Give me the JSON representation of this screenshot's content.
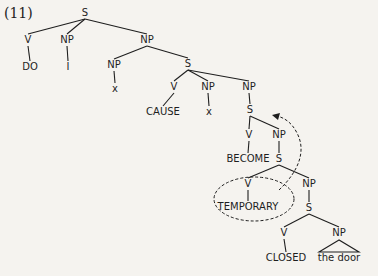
{
  "example_number": "(11)",
  "colors": {
    "ink": "#1e1e1e",
    "background": "#f5f3ef"
  },
  "nodes": [
    {
      "id": "s0",
      "label": "S",
      "x": 85,
      "y": 13
    },
    {
      "id": "v1",
      "label": "V",
      "x": 28,
      "y": 40
    },
    {
      "id": "np1",
      "label": "NP",
      "x": 67,
      "y": 40
    },
    {
      "id": "np2",
      "label": "NP",
      "x": 147,
      "y": 40
    },
    {
      "id": "do",
      "label": "DO",
      "x": 30,
      "y": 67
    },
    {
      "id": "i",
      "label": "I",
      "x": 68,
      "y": 67
    },
    {
      "id": "np3",
      "label": "NP",
      "x": 114,
      "y": 65
    },
    {
      "id": "s1",
      "label": "S",
      "x": 188,
      "y": 64
    },
    {
      "id": "x1",
      "label": "x",
      "x": 115,
      "y": 89
    },
    {
      "id": "v2",
      "label": "V",
      "x": 174,
      "y": 87
    },
    {
      "id": "np4",
      "label": "NP",
      "x": 208,
      "y": 87
    },
    {
      "id": "np5",
      "label": "NP",
      "x": 249,
      "y": 87
    },
    {
      "id": "cause",
      "label": "CAUSE",
      "x": 163,
      "y": 112
    },
    {
      "id": "x2",
      "label": "x",
      "x": 209,
      "y": 112
    },
    {
      "id": "s2",
      "label": "S",
      "x": 250,
      "y": 110
    },
    {
      "id": "v3",
      "label": "V",
      "x": 249,
      "y": 135
    },
    {
      "id": "np6",
      "label": "NP",
      "x": 279,
      "y": 135
    },
    {
      "id": "become",
      "label": "BECOME",
      "x": 248,
      "y": 159
    },
    {
      "id": "s3",
      "label": "S",
      "x": 279,
      "y": 159
    },
    {
      "id": "v4",
      "label": "V",
      "x": 248,
      "y": 184
    },
    {
      "id": "np7",
      "label": "NP",
      "x": 309,
      "y": 184
    },
    {
      "id": "temporary",
      "label": "TEMPORARY",
      "x": 248,
      "y": 207
    },
    {
      "id": "s4",
      "label": "S",
      "x": 309,
      "y": 208
    },
    {
      "id": "v5",
      "label": "V",
      "x": 284,
      "y": 233
    },
    {
      "id": "np8",
      "label": "NP",
      "x": 339,
      "y": 233
    },
    {
      "id": "closed",
      "label": "CLOSED",
      "x": 286,
      "y": 258
    },
    {
      "id": "thedoor",
      "label": "the door",
      "x": 339,
      "y": 258
    }
  ],
  "edges": [
    [
      "s0",
      "v1"
    ],
    [
      "s0",
      "np1"
    ],
    [
      "s0",
      "np2"
    ],
    [
      "v1",
      "do"
    ],
    [
      "np1",
      "i"
    ],
    [
      "np2",
      "np3"
    ],
    [
      "np2",
      "s1"
    ],
    [
      "np3",
      "x1"
    ],
    [
      "s1",
      "v2"
    ],
    [
      "s1",
      "np4"
    ],
    [
      "s1",
      "np5"
    ],
    [
      "v2",
      "cause"
    ],
    [
      "np4",
      "x2"
    ],
    [
      "np5",
      "s2"
    ],
    [
      "s2",
      "v3"
    ],
    [
      "s2",
      "np6"
    ],
    [
      "v3",
      "become"
    ],
    [
      "np6",
      "s3"
    ],
    [
      "s3",
      "v4"
    ],
    [
      "s3",
      "np7"
    ],
    [
      "v4",
      "temporary"
    ],
    [
      "np7",
      "s4"
    ],
    [
      "s4",
      "v5"
    ],
    [
      "s4",
      "np8"
    ],
    [
      "v5",
      "closed"
    ]
  ],
  "annotations": {
    "circled_node": "TEMPORARY",
    "arrow_description": "dashed arrow from circled V/TEMPORARY up to S under NP (predicate raising)"
  }
}
